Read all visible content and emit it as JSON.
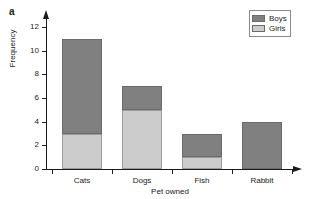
{
  "panel": {
    "label": "a"
  },
  "legend": {
    "position": "top-right",
    "entries": [
      {
        "label": "Boys",
        "color": "#808080"
      },
      {
        "label": "Girls",
        "color": "#cccccc"
      }
    ]
  },
  "axes": {
    "y_title": "Frequency",
    "x_title": "Pet owned",
    "y_ticks": [
      "0",
      "2",
      "4",
      "6",
      "8",
      "10",
      "12"
    ],
    "x_ticks": [
      "Cats",
      "Dogs",
      "Fish",
      "Rabbit"
    ]
  },
  "chart_data": {
    "type": "bar",
    "stacked": true,
    "title": "",
    "xlabel": "Pet owned",
    "ylabel": "Frequency",
    "categories": [
      "Cats",
      "Dogs",
      "Fish",
      "Rabbit"
    ],
    "series": [
      {
        "name": "Girls",
        "color": "#cccccc",
        "values": [
          3,
          5,
          1,
          0
        ]
      },
      {
        "name": "Boys",
        "color": "#808080",
        "values": [
          8,
          2,
          2,
          4
        ]
      }
    ],
    "totals": [
      11,
      7,
      3,
      4
    ],
    "ylim": [
      0,
      12
    ],
    "ytick_step": 2,
    "grid": false,
    "legend_position": "top-right"
  }
}
